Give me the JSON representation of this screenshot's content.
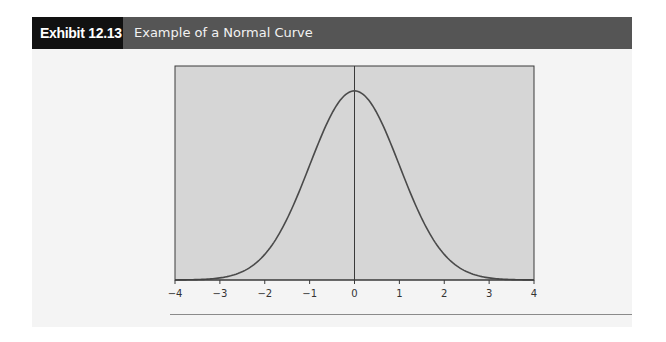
{
  "header": {
    "exhibit_label": "Exhibit 12.13",
    "title": "Example of a Normal Curve"
  },
  "colors": {
    "header_dark": "#111111",
    "header_gray": "#555555",
    "panel_bg": "#f4f4f4",
    "plot_bg": "#d6d6d6",
    "curve": "#4a4a4a"
  },
  "chart_data": {
    "type": "line",
    "title": "Example of a Normal Curve",
    "xlabel": "",
    "ylabel": "",
    "xlim": [
      -4,
      4
    ],
    "ylim": [
      0,
      0.45
    ],
    "grid": false,
    "legend": null,
    "x_tick_labels": [
      "−4",
      "−3",
      "−2",
      "−1",
      "0",
      "1",
      "2",
      "3",
      "4"
    ],
    "x_ticks": [
      -4,
      -3,
      -2,
      -1,
      0,
      1,
      2,
      3,
      4
    ],
    "annotations": [
      "vertical line at x = 0"
    ],
    "series": [
      {
        "name": "Standard normal density",
        "x": [
          -4,
          -3.5,
          -3,
          -2.5,
          -2,
          -1.5,
          -1,
          -0.5,
          0,
          0.5,
          1,
          1.5,
          2,
          2.5,
          3,
          3.5,
          4
        ],
        "y": [
          0.0001,
          0.0009,
          0.0044,
          0.0175,
          0.054,
          0.1295,
          0.242,
          0.3521,
          0.3989,
          0.3521,
          0.242,
          0.1295,
          0.054,
          0.0175,
          0.0044,
          0.0009,
          0.0001
        ]
      }
    ]
  }
}
